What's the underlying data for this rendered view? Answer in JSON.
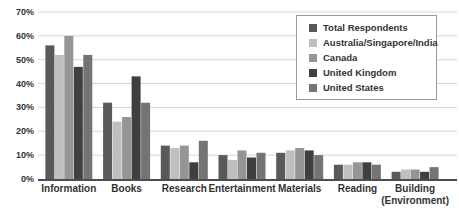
{
  "chart_data": {
    "type": "bar",
    "title": "",
    "xlabel": "",
    "ylabel": "",
    "categories": [
      "Information",
      "Books",
      "Research",
      "Entertainment",
      "Materials",
      "Reading",
      "Building\n(Environment)"
    ],
    "series": [
      {
        "name": "Total Respondents",
        "color": "#595959",
        "values": [
          56,
          32,
          14,
          10,
          11,
          6,
          3
        ]
      },
      {
        "name": "Australia/Singapore/India",
        "color": "#bfbfbf",
        "values": [
          52,
          24,
          13,
          8,
          12,
          6,
          4
        ]
      },
      {
        "name": "Canada",
        "color": "#959595",
        "values": [
          60,
          26,
          14,
          12,
          13,
          7,
          4
        ]
      },
      {
        "name": "United Kingdom",
        "color": "#3f3f3f",
        "values": [
          47,
          43,
          7,
          9,
          12,
          7,
          3
        ]
      },
      {
        "name": "United States",
        "color": "#747474",
        "values": [
          52,
          32,
          16,
          11,
          10,
          6,
          5
        ]
      }
    ],
    "y_axis": {
      "min": 0,
      "max": 70,
      "step": 10,
      "tick_labels": [
        "0%",
        "10%",
        "20%",
        "30%",
        "40%",
        "50%",
        "60%",
        "70%"
      ]
    },
    "grid": true,
    "legend_position": "top-right"
  },
  "colors": {
    "background": "#ffffff",
    "gridline": "#d6d6d6",
    "axis_line": "#4d4d4d",
    "tick_text": "#333333",
    "category_text": "#333333",
    "legend_border": "#9a9a9a"
  }
}
